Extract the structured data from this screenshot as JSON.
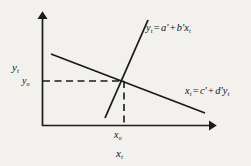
{
  "figure": {
    "background_color": "#f2f1ed",
    "line_color": "#1a1a1a",
    "type": "economics-equilibrium-diagram"
  },
  "axes": {
    "y_axis_label": "y",
    "y_axis_subscript": "t",
    "x_axis_label": "x",
    "x_axis_subscript": "t",
    "origin": {
      "x": 42,
      "y": 126
    },
    "y_axis_top": 12,
    "x_axis_right": 216
  },
  "equations": {
    "upward": {
      "lhs": "y",
      "lhs_sub": "t",
      "eq": "=",
      "intercept": "a'",
      "plus": "+",
      "slope": "b'",
      "var": "x",
      "var_sub": "t",
      "full_text": "y_t = a' + b'x_t"
    },
    "downward": {
      "lhs": "x",
      "lhs_sub": "t",
      "eq": "=",
      "intercept": "c'",
      "plus": "+",
      "slope": "d'",
      "var": "y",
      "var_sub": "t",
      "full_text": "x_t = c' + d'y_t"
    }
  },
  "equilibrium": {
    "point": {
      "x": 124,
      "y": 81
    },
    "y_value_label": "y",
    "y_value_sub": "o",
    "x_value_label": "x",
    "x_value_sub": "o"
  },
  "lines": {
    "upward_line": {
      "x1": 105,
      "y1": 118,
      "x2": 148,
      "y2": 20
    },
    "downward_line": {
      "x1": 51,
      "y1": 54,
      "x2": 205,
      "y2": 113
    },
    "dashed_horizontal": {
      "x1": 43,
      "y1": 81,
      "x2": 124,
      "y2": 81
    },
    "dashed_vertical": {
      "x1": 124,
      "y1": 81,
      "x2": 124,
      "y2": 126
    }
  }
}
